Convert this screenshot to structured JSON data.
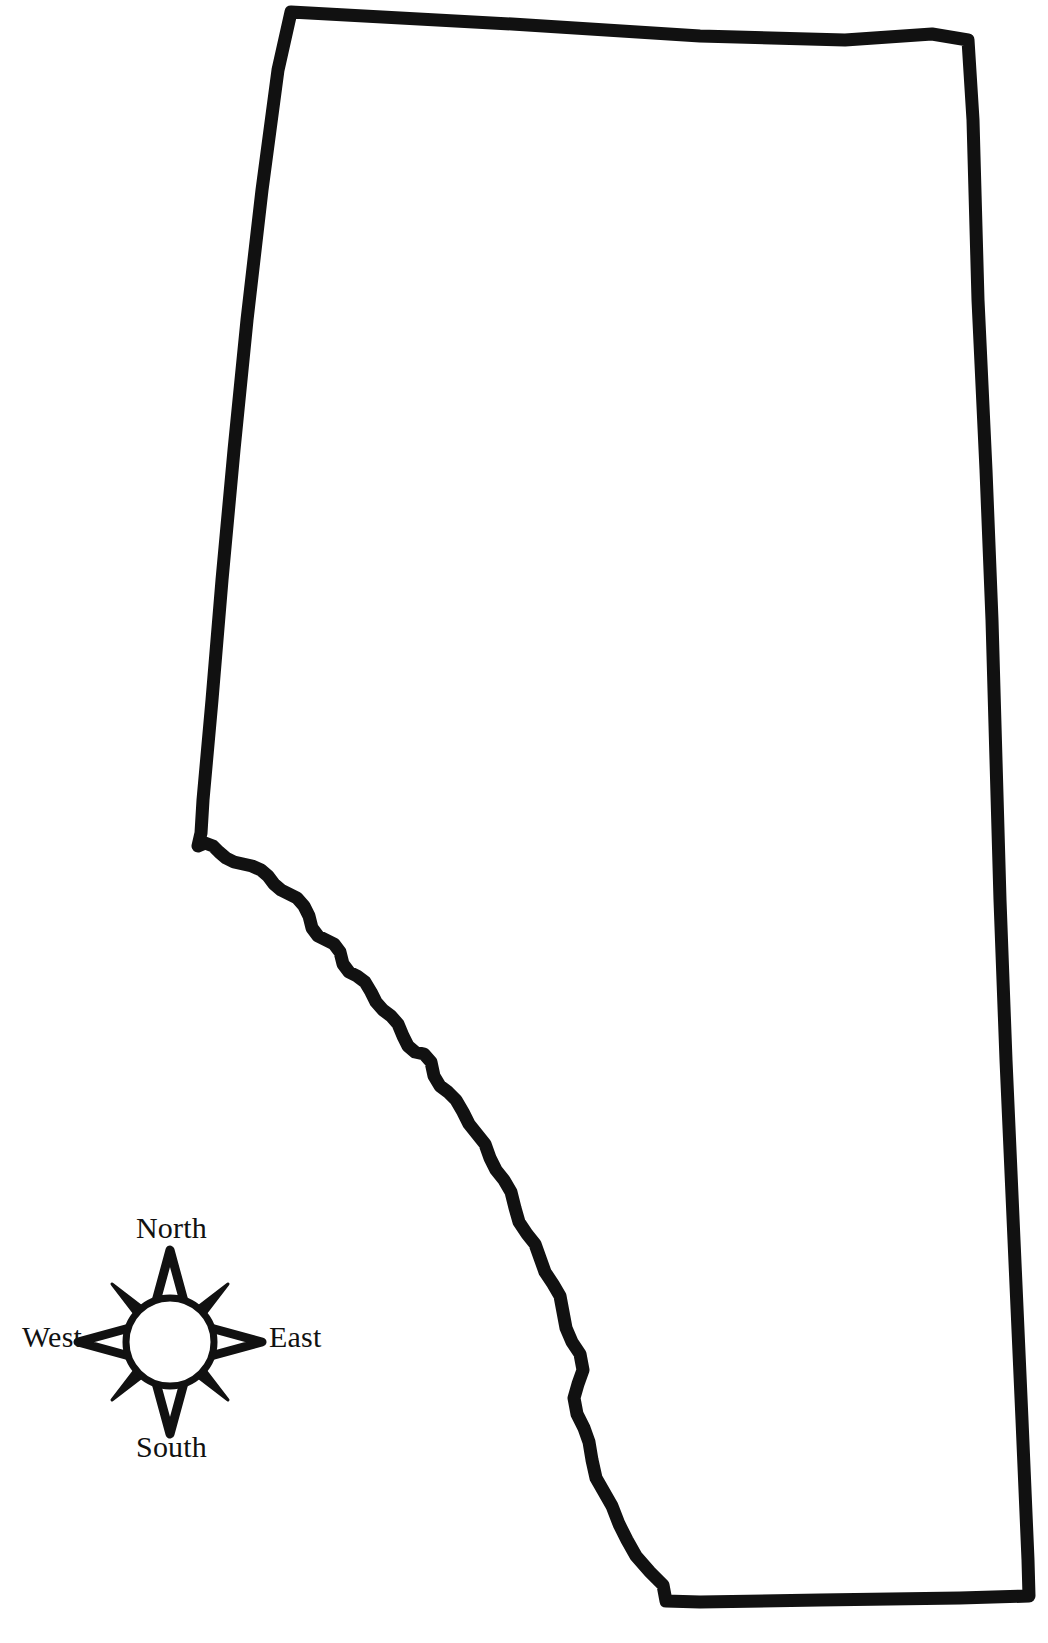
{
  "page": {
    "background_color": "#ffffff",
    "ink_color": "#000000",
    "width": 1048,
    "height": 1643
  },
  "map": {
    "name": "alberta-outline",
    "description": "Blank outline map of the province of Alberta, Canada",
    "stroke_color": "#111111",
    "fill_color": "#ffffff",
    "stroke_width": 13
  },
  "compass": {
    "name": "compass-rose",
    "style": "eight-point star with hollow cardinal points, solid ordinal points and white center circle",
    "point_fill": "#111111",
    "center_fill": "#ffffff",
    "labels": {
      "north": "North",
      "south": "South",
      "east": "East",
      "west": "West"
    }
  }
}
